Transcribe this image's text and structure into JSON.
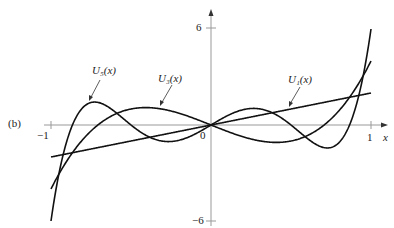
{
  "panel_label": "(b)",
  "axes": {
    "x_label": "x",
    "x_ticks": [
      {
        "value": -1,
        "label": "−1"
      },
      {
        "value": 0,
        "label": "0"
      },
      {
        "value": 1,
        "label": "1"
      }
    ],
    "y_ticks": [
      {
        "value": 6,
        "label": "6"
      },
      {
        "value": -6,
        "label": "−6"
      }
    ]
  },
  "curve_labels": {
    "u5": "U₅(x)",
    "u3": "U₃(x)",
    "u1": "U₁(x)"
  },
  "colors": {
    "curve": "#111111",
    "axis": "#999999"
  },
  "chart_data": {
    "type": "line",
    "title": "",
    "xlabel": "x",
    "ylabel": "",
    "xlim": [
      -1.05,
      1.1
    ],
    "ylim": [
      -6.3,
      7
    ],
    "grid": false,
    "legend": "inline labels with pointer arrows",
    "series": [
      {
        "name": "U1(x)",
        "formula": "2x",
        "x": [
          -1,
          -0.5,
          0,
          0.5,
          1
        ],
        "values": [
          -2,
          -1,
          0,
          1,
          2
        ]
      },
      {
        "name": "U3(x)",
        "formula": "8x^3-4x",
        "x": [
          -1,
          -0.75,
          -0.5,
          -0.25,
          0,
          0.25,
          0.5,
          0.75,
          1
        ],
        "values": [
          -4,
          -0.375,
          1,
          0.875,
          0,
          -0.875,
          -1,
          0.375,
          4
        ]
      },
      {
        "name": "U5(x)",
        "formula": "32x^5-32x^3+6x",
        "x": [
          -1,
          -0.9,
          -0.75,
          -0.5,
          -0.25,
          0,
          0.25,
          0.5,
          0.75,
          0.9,
          1
        ],
        "values": [
          -6,
          -0.23,
          1.77,
          -1,
          -1.03,
          0,
          1.03,
          1,
          -1.77,
          0.23,
          6
        ]
      }
    ]
  }
}
